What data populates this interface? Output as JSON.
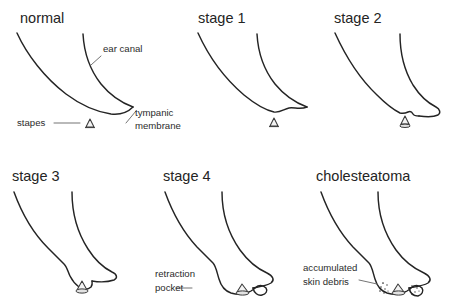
{
  "figure": {
    "background_color": "#ffffff",
    "stroke_color": "#242424",
    "label_color": "#2b2b2b",
    "leader_color": "#6d6d6d"
  },
  "panels": [
    {
      "id": "normal",
      "title": "normal",
      "annotations": [
        {
          "id": "ear-canal",
          "text": "ear canal"
        },
        {
          "id": "stapes",
          "text": "stapes"
        },
        {
          "id": "tympanic-membrane-line1",
          "text": "tympanic"
        },
        {
          "id": "tympanic-membrane-line2",
          "text": "membrane"
        }
      ]
    },
    {
      "id": "stage-1",
      "title": "stage 1",
      "annotations": []
    },
    {
      "id": "stage-2",
      "title": "stage 2",
      "annotations": []
    },
    {
      "id": "stage-3",
      "title": "stage 3",
      "annotations": []
    },
    {
      "id": "stage-4",
      "title": "stage 4",
      "annotations": [
        {
          "id": "retraction-pocket-line1",
          "text": "retraction"
        },
        {
          "id": "retraction-pocket-line2",
          "text": "pocket"
        }
      ]
    },
    {
      "id": "cholesteatoma",
      "title": "cholesteatoma",
      "annotations": [
        {
          "id": "accumulated-skin-debris-line1",
          "text": "accumulated"
        },
        {
          "id": "accumulated-skin-debris-line2",
          "text": "skin debris"
        }
      ]
    }
  ]
}
